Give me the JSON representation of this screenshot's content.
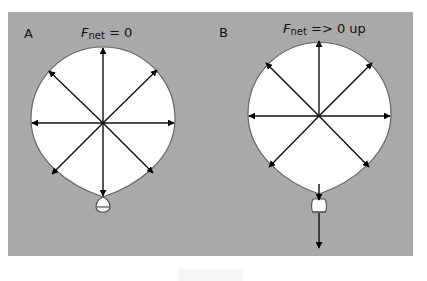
{
  "panel": {
    "background": "#a9a9a9"
  },
  "diagram_a": {
    "label": "A",
    "force_symbol": "F",
    "force_subscript": "net",
    "force_relation": " = 0",
    "balloon": {
      "cx": 103,
      "cy": 119,
      "r": 72,
      "fill": "#ffffff",
      "stroke": "#555555"
    },
    "arrows": [
      "up",
      "up-right",
      "right",
      "down-right",
      "down",
      "down-left",
      "left",
      "up-left"
    ],
    "knot": "closed"
  },
  "diagram_b": {
    "label": "B",
    "force_symbol": "F",
    "force_subscript": "net",
    "force_relation": " => 0 up",
    "balloon": {
      "cx": 319,
      "cy": 114,
      "r": 72,
      "fill": "#ffffff",
      "stroke": "#555555"
    },
    "arrows": [
      "up",
      "up-right",
      "right",
      "down-right",
      "down-left",
      "left",
      "up-left"
    ],
    "neck_arrows": [
      "down-into-neck",
      "down-out-of-opening"
    ],
    "knot": "open"
  }
}
